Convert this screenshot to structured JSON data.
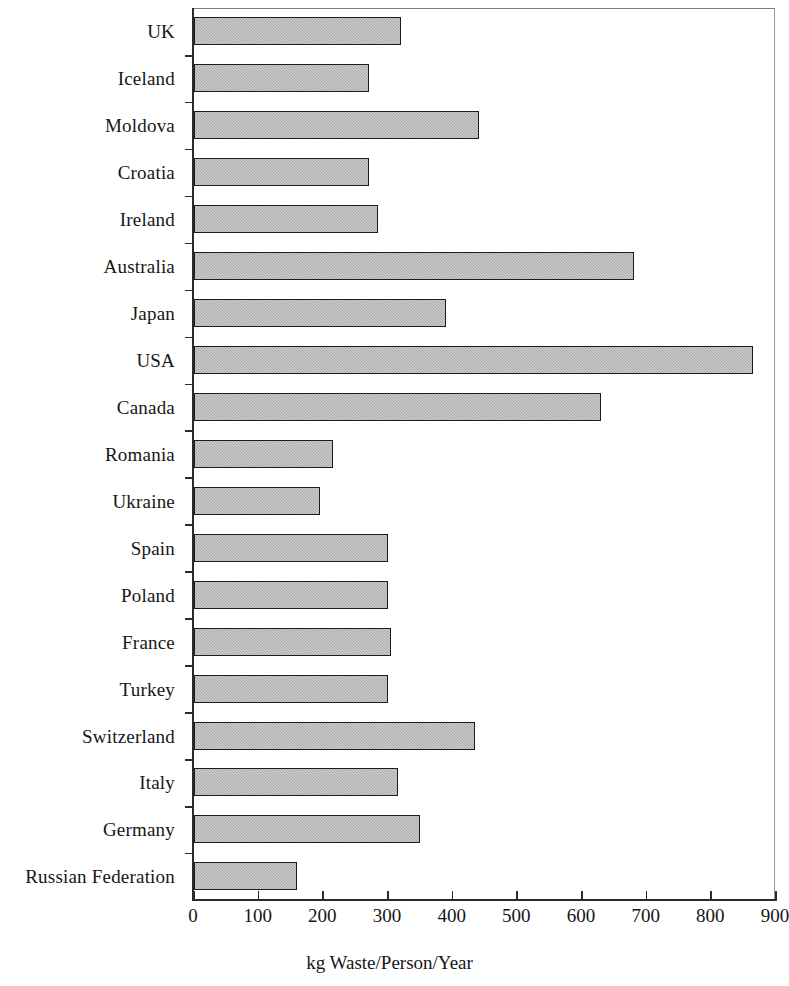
{
  "chart_data": {
    "type": "bar",
    "orientation": "horizontal",
    "title": "",
    "xlabel": "kg Waste/Person/Year",
    "ylabel": "",
    "xlim": [
      0,
      900
    ],
    "xticks": [
      0,
      100,
      200,
      300,
      400,
      500,
      600,
      700,
      800,
      900
    ],
    "xtick_labels": [
      "0",
      "100",
      "200",
      "300",
      "400",
      "500",
      "600",
      "700",
      "800",
      "900"
    ],
    "grid": false,
    "legend": null,
    "bar_fill_color": "#a8a8a8",
    "bar_edge_color": "#1c1c1c",
    "categories": [
      "UK",
      "Iceland",
      "Moldova",
      "Croatia",
      "Ireland",
      "Australia",
      "Japan",
      "USA",
      "Canada",
      "Romania",
      "Ukraine",
      "Spain",
      "Poland",
      "France",
      "Turkey",
      "Switzerland",
      "Italy",
      "Germany",
      "Russian Federation"
    ],
    "values": [
      320,
      270,
      440,
      270,
      285,
      680,
      390,
      865,
      630,
      215,
      195,
      300,
      300,
      305,
      300,
      435,
      315,
      350,
      160
    ]
  }
}
